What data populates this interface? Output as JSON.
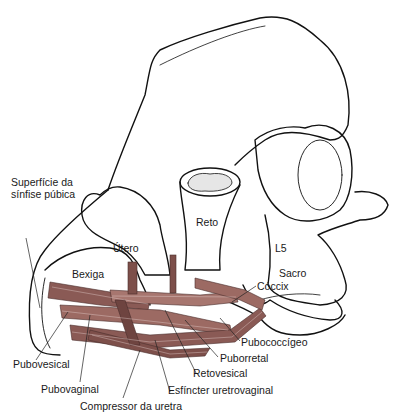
{
  "diagram": {
    "colors": {
      "muscle": "#8a5a55",
      "muscle_light": "#c9a29c",
      "outline": "#111111",
      "background": "#ffffff"
    },
    "labels": {
      "superficie": "Superfície da sínfise púbica",
      "utero": "Útero",
      "reto": "Reto",
      "l5": "L5",
      "sacro": "Sacro",
      "bexiga": "Bexiga",
      "coccix": "Cóccix",
      "pubococcigeo": "Pubococcígeo",
      "puborretal": "Puborretal",
      "retovesical": "Retovesical",
      "esfincter": "Esfíncter uretrovaginal",
      "compressor": "Compressor da uretra",
      "pubovaginal": "Pubovaginal",
      "pubovesical": "Pubovesical"
    }
  }
}
